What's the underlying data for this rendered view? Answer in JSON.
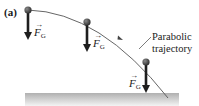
{
  "figure": {
    "panel_label": "(a)",
    "trajectory_label_line1": "Parabolic",
    "trajectory_label_line2": "trajectory",
    "forces": [
      {
        "symbol": "F",
        "subscript": "G",
        "vector_mark": "→"
      },
      {
        "symbol": "F",
        "subscript": "G",
        "vector_mark": "→"
      },
      {
        "symbol": "F",
        "subscript": "G",
        "vector_mark": "→"
      }
    ],
    "colors": {
      "ball": "#3a3a3a",
      "arrow": "#1e1e1e",
      "curve": "#555555",
      "ground_top": "#b5b5b5",
      "ground_bottom": "#f2f2f2"
    }
  }
}
